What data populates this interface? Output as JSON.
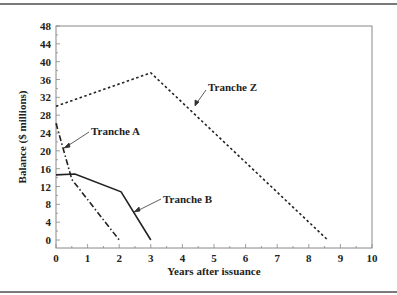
{
  "chart_data": {
    "type": "line",
    "title": "",
    "xlabel": "Years after issuance",
    "ylabel": "Balance ($ millions)",
    "xlim": [
      0,
      10
    ],
    "ylim": [
      0,
      48
    ],
    "x_ticks": [
      "0",
      "1",
      "2",
      "3",
      "4",
      "5",
      "6",
      "7",
      "8",
      "9",
      "10"
    ],
    "y_ticks": [
      "0",
      "4",
      "8",
      "12",
      "16",
      "20",
      "24",
      "28",
      "32",
      "36",
      "40",
      "44",
      "48"
    ],
    "grid": false,
    "legend": "inline annotations with leader arrows",
    "series": [
      {
        "name": "Tranche A",
        "style": "dash-dot",
        "points": [
          [
            0,
            26.2
          ],
          [
            0.5,
            13.6
          ],
          [
            2.0,
            0
          ]
        ]
      },
      {
        "name": "Tranche B",
        "style": "solid",
        "points": [
          [
            0,
            14.6
          ],
          [
            0.6,
            14.8
          ],
          [
            2.06,
            10.8
          ],
          [
            3.0,
            0
          ]
        ]
      },
      {
        "name": "Tranche Z",
        "style": "dotted",
        "points": [
          [
            0,
            30.0
          ],
          [
            3.0,
            37.5
          ],
          [
            8.6,
            0
          ]
        ]
      }
    ],
    "annotations": [
      "Tranche A",
      "Tranche B",
      "Tranche Z"
    ]
  },
  "labels": {
    "tranche_a": "Tranche A",
    "tranche_b": "Tranche B",
    "tranche_z": "Tranche Z",
    "xlabel": "Years after issuance",
    "ylabel": "Balance ($ millions)"
  }
}
